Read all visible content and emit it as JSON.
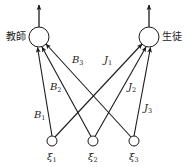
{
  "diagram": {
    "stroke_color": "#1a1a1a",
    "nodes": {
      "teacher": {
        "label": "教師",
        "cx": 39,
        "cy": 37,
        "r": 10
      },
      "student": {
        "label": "生徒",
        "cx": 149,
        "cy": 37,
        "r": 10
      },
      "inputs": [
        {
          "label": "ξ",
          "sub": "1",
          "cx": 52,
          "cy": 141,
          "r": 5
        },
        {
          "label": "ξ",
          "sub": "2",
          "cx": 93,
          "cy": 141,
          "r": 5
        },
        {
          "label": "ξ",
          "sub": "3",
          "cx": 134,
          "cy": 141,
          "r": 5
        }
      ]
    },
    "edges": [
      {
        "from": "xi1",
        "to": "teacher",
        "label": "B",
        "sub": "1"
      },
      {
        "from": "xi2",
        "to": "teacher",
        "label": "B",
        "sub": "2"
      },
      {
        "from": "xi3",
        "to": "teacher",
        "label": "B",
        "sub": "3"
      },
      {
        "from": "xi1",
        "to": "student",
        "label": "J",
        "sub": "1"
      },
      {
        "from": "xi2",
        "to": "student",
        "label": "J",
        "sub": "2"
      },
      {
        "from": "xi3",
        "to": "student",
        "label": "J",
        "sub": "3"
      }
    ],
    "outputs": [
      {
        "from": "teacher",
        "direction": "up"
      },
      {
        "from": "student",
        "direction": "up"
      }
    ]
  }
}
